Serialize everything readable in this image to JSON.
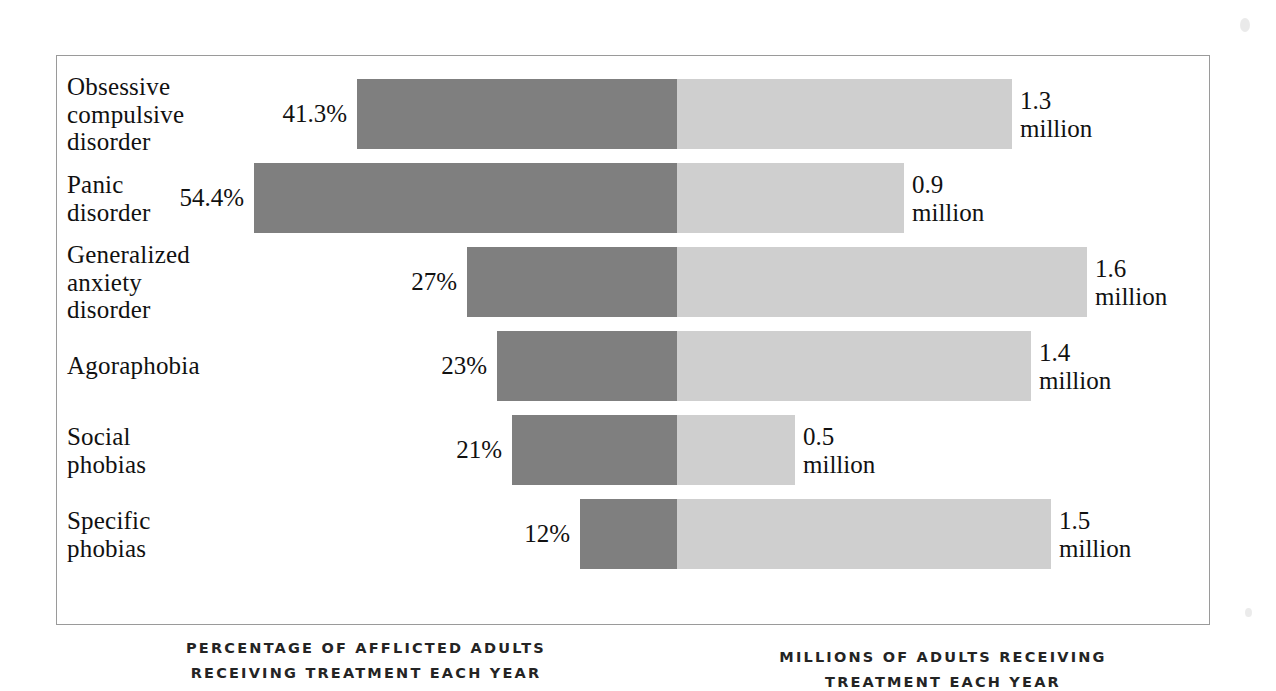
{
  "chart_data": {
    "type": "bar",
    "title": "",
    "subtitle": "",
    "orientation": "horizontal",
    "layout": "diverging-bidirectional",
    "categories": [
      "Obsessive\ncompulsive\ndisorder",
      "Panic\ndisorder",
      "Generalized\nanxiety\ndisorder",
      "Agoraphobia",
      "Social\nphobias",
      "Specific\nphobias"
    ],
    "series": [
      {
        "name": "Percentage of afflicted adults receiving treatment each year",
        "side": "left",
        "unit": "%",
        "color": "#7f7f7f",
        "values": [
          41.3,
          54.4,
          27,
          23,
          21,
          12
        ],
        "labels": [
          "41.3%",
          "54.4%",
          "27%",
          "23%",
          "21%",
          "12%"
        ]
      },
      {
        "name": "Millions of adults receiving treatment each year",
        "side": "right",
        "unit": "million",
        "color": "#cfcfcf",
        "values": [
          1.3,
          0.9,
          1.6,
          1.4,
          0.5,
          1.5
        ],
        "labels": [
          "1.3\nmillion",
          "0.9\nmillion",
          "1.6\nmillion",
          "1.4\nmillion",
          "0.5\nmillion",
          "1.5\nmillion"
        ]
      }
    ],
    "xlabel_left": "PERCENTAGE OF AFFLICTED ADULTS\nRECEIVING TREATMENT EACH YEAR",
    "xlabel_right": "MILLIONS OF ADULTS RECEIVING\nTREATMENT EACH YEAR",
    "ylabel": "",
    "grid": true,
    "gridline_count": 16,
    "legend": "none"
  },
  "axis_captions": {
    "left_line1": "PERCENTAGE OF AFFLICTED ADULTS",
    "left_line2": "RECEIVING TREATMENT EACH YEAR",
    "right_line1": "MILLIONS OF ADULTS RECEIVING",
    "right_line2": "TREATMENT EACH YEAR"
  },
  "rows": [
    {
      "category": "Obsessive\ncompulsive\ndisorder",
      "pct_label": "41.3%",
      "mil_label": "1.3\nmillion",
      "left_bar_x": 300,
      "left_bar_w": 320,
      "right_bar_w": 335
    },
    {
      "category": "Panic\ndisorder",
      "pct_label": "54.4%",
      "mil_label": "0.9\nmillion",
      "left_bar_x": 197,
      "left_bar_w": 423,
      "right_bar_w": 227
    },
    {
      "category": "Generalized\nanxiety\ndisorder",
      "pct_label": "27%",
      "mil_label": "1.6\nmillion",
      "left_bar_x": 410,
      "left_bar_w": 210,
      "right_bar_w": 410
    },
    {
      "category": "Agoraphobia",
      "pct_label": "23%",
      "mil_label": "1.4\nmillion",
      "left_bar_x": 440,
      "left_bar_w": 180,
      "right_bar_w": 354
    },
    {
      "category": "Social\nphobias",
      "pct_label": "21%",
      "mil_label": "0.5\nmillion",
      "left_bar_x": 455,
      "left_bar_w": 165,
      "right_bar_w": 118
    },
    {
      "category": "Specific\nphobias",
      "pct_label": "12%",
      "mil_label": "1.5\nmillion",
      "left_bar_x": 523,
      "left_bar_w": 97,
      "right_bar_w": 374
    }
  ],
  "colors": {
    "left_bar": "#7f7f7f",
    "right_bar": "#cfcfcf",
    "gridline": "#b4b4b4",
    "frame": "#9a9a9a",
    "text": "#111111",
    "background": "#ffffff"
  },
  "geometry": {
    "frame_left": 56,
    "frame_top": 55,
    "frame_width": 1154,
    "frame_height": 570,
    "center_x_in_frame": 620,
    "gridline_spacing": 77,
    "row_height": 70,
    "row_pitch": 84,
    "row_tops": [
      23,
      107,
      191,
      275,
      359,
      443
    ]
  }
}
